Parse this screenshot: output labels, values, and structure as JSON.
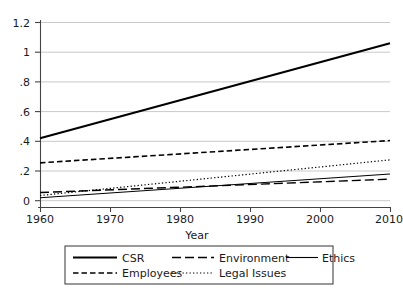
{
  "chart_data": {
    "type": "line",
    "title": "",
    "subtitle": "",
    "xlabel": "Year",
    "ylabel": "",
    "xlim": [
      1960,
      2010
    ],
    "ylim": [
      0,
      1.2
    ],
    "grid": true,
    "grid_axis": "y",
    "legend_position": "bottom",
    "x": [
      1960,
      2010
    ],
    "xticks": [
      1960,
      1970,
      1980,
      1990,
      2000,
      2010
    ],
    "xtick_labels": [
      "1960",
      "1970",
      "1980",
      "1990",
      "2000",
      "2010"
    ],
    "yticks": [
      0,
      0.2,
      0.4,
      0.6,
      0.8,
      1,
      1.2
    ],
    "ytick_labels": [
      "0",
      ".2",
      ".4",
      ".6",
      ".8",
      "1",
      "1.2"
    ],
    "series": [
      {
        "name": "CSR",
        "style": "solid-thick",
        "color": "#000000",
        "values": [
          0.42,
          1.06
        ]
      },
      {
        "name": "Employees",
        "style": "dashed",
        "color": "#000000",
        "values": [
          0.255,
          0.405
        ]
      },
      {
        "name": "Legal Issues",
        "style": "dotted",
        "color": "#000000",
        "values": [
          0.035,
          0.275
        ]
      },
      {
        "name": "Ethics",
        "style": "solid-thin",
        "color": "#000000",
        "values": [
          0.02,
          0.18
        ]
      },
      {
        "name": "Environment",
        "style": "long-dash",
        "color": "#000000",
        "values": [
          0.055,
          0.145
        ]
      }
    ]
  },
  "axes": {
    "x_title": "Year",
    "x_ticks": [
      "1960",
      "1970",
      "1980",
      "1990",
      "2000",
      "2010"
    ],
    "y_ticks": [
      "1.2",
      "1",
      ".8",
      ".6",
      ".4",
      ".2",
      "0"
    ]
  },
  "legend": {
    "row1": [
      {
        "label": "CSR",
        "style": "solid-thick"
      },
      {
        "label": "Environment",
        "style": "long-dash"
      },
      {
        "label": "Ethics",
        "style": "solid-thin"
      }
    ],
    "row2": [
      {
        "label": "Employees",
        "style": "dashed"
      },
      {
        "label": "Legal Issues",
        "style": "dotted"
      }
    ]
  },
  "colors": {
    "line": "#000000",
    "grid": "#c9c9c9",
    "axis": "#555555",
    "background": "#ffffff"
  }
}
